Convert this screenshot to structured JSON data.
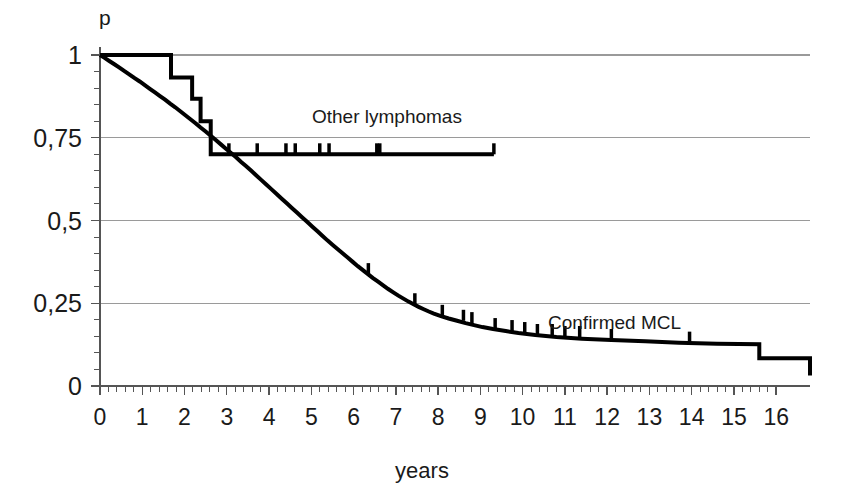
{
  "chart_data": {
    "type": "line",
    "title": "",
    "subtitle": "",
    "xlabel": "years",
    "ylabel": "p",
    "xlim": [
      0,
      16.8
    ],
    "ylim": [
      0,
      1
    ],
    "grid": true,
    "grid_axis": "y",
    "legend_position": "inline-annotations",
    "x_ticks": [
      "0",
      "1",
      "2",
      "3",
      "4",
      "5",
      "6",
      "7",
      "8",
      "9",
      "10",
      "11",
      "12",
      "13",
      "14",
      "15",
      "16"
    ],
    "x_tick_values": [
      0,
      1,
      2,
      3,
      4,
      5,
      6,
      7,
      8,
      9,
      10,
      11,
      12,
      13,
      14,
      15,
      16
    ],
    "x_minor_tick_interval": 0.2,
    "y_ticks": [
      "1",
      "0,75",
      "0,5",
      "0,25",
      "0"
    ],
    "y_tick_values": [
      1,
      0.75,
      0.5,
      0.25,
      0
    ],
    "y_minor_tick_interval": 0.05,
    "decimal_separator": ",",
    "line_color": "#000000",
    "grid_color": "#9a9a9a",
    "axis_color": "#555555",
    "background_color": "#ffffff",
    "series": [
      {
        "name": "Other lymphomas",
        "annotation": "Other lymphomas",
        "annotation_x": 5.0,
        "annotation_y": 0.845,
        "style": "step",
        "color": "#000000",
        "line_width": 4,
        "points": [
          [
            0.0,
            1.0
          ],
          [
            1.68,
            1.0
          ],
          [
            1.68,
            0.932
          ],
          [
            2.18,
            0.932
          ],
          [
            2.18,
            0.868
          ],
          [
            2.38,
            0.868
          ],
          [
            2.38,
            0.8
          ],
          [
            2.62,
            0.8
          ],
          [
            2.62,
            0.7
          ],
          [
            9.32,
            0.7
          ]
        ],
        "censored_x": [
          3.05,
          3.72,
          4.4,
          4.62,
          5.2,
          5.42,
          6.55,
          6.62,
          9.32
        ],
        "censored_y": 0.7
      },
      {
        "name": "Confirmed MCL",
        "annotation": "Confirmed MCL",
        "annotation_x": 11.4,
        "annotation_y": 0.205,
        "style": "step",
        "color": "#000000",
        "line_width": 4,
        "points": [
          [
            0.0,
            1.0
          ],
          [
            0.1,
            0.992
          ],
          [
            0.22,
            0.982
          ],
          [
            0.34,
            0.972
          ],
          [
            0.46,
            0.962
          ],
          [
            0.58,
            0.951
          ],
          [
            0.7,
            0.941
          ],
          [
            0.82,
            0.93
          ],
          [
            0.94,
            0.92
          ],
          [
            1.06,
            0.909
          ],
          [
            1.18,
            0.898
          ],
          [
            1.3,
            0.887
          ],
          [
            1.42,
            0.876
          ],
          [
            1.54,
            0.865
          ],
          [
            1.66,
            0.853
          ],
          [
            1.78,
            0.842
          ],
          [
            1.9,
            0.83
          ],
          [
            2.02,
            0.818
          ],
          [
            2.14,
            0.806
          ],
          [
            2.26,
            0.794
          ],
          [
            2.38,
            0.781
          ],
          [
            2.5,
            0.769
          ],
          [
            2.62,
            0.756
          ],
          [
            2.74,
            0.743
          ],
          [
            2.86,
            0.73
          ],
          [
            2.98,
            0.717
          ],
          [
            3.1,
            0.704
          ],
          [
            3.22,
            0.691
          ],
          [
            3.34,
            0.677
          ],
          [
            3.46,
            0.664
          ],
          [
            3.58,
            0.65
          ],
          [
            3.7,
            0.636
          ],
          [
            3.82,
            0.622
          ],
          [
            3.94,
            0.608
          ],
          [
            4.06,
            0.594
          ],
          [
            4.18,
            0.58
          ],
          [
            4.3,
            0.566
          ],
          [
            4.42,
            0.552
          ],
          [
            4.54,
            0.538
          ],
          [
            4.66,
            0.524
          ],
          [
            4.78,
            0.51
          ],
          [
            4.9,
            0.496
          ],
          [
            5.02,
            0.482
          ],
          [
            5.14,
            0.468
          ],
          [
            5.26,
            0.454
          ],
          [
            5.38,
            0.44
          ],
          [
            5.5,
            0.427
          ],
          [
            5.62,
            0.414
          ],
          [
            5.74,
            0.401
          ],
          [
            5.86,
            0.388
          ],
          [
            5.98,
            0.375
          ],
          [
            6.1,
            0.362
          ],
          [
            6.22,
            0.35
          ],
          [
            6.34,
            0.338
          ],
          [
            6.46,
            0.326
          ],
          [
            6.58,
            0.315
          ],
          [
            6.7,
            0.304
          ],
          [
            6.82,
            0.293
          ],
          [
            6.94,
            0.283
          ],
          [
            7.06,
            0.273
          ],
          [
            7.18,
            0.264
          ],
          [
            7.3,
            0.255
          ],
          [
            7.42,
            0.247
          ],
          [
            7.54,
            0.239
          ],
          [
            7.66,
            0.232
          ],
          [
            7.78,
            0.225
          ],
          [
            7.9,
            0.219
          ],
          [
            8.05,
            0.212
          ],
          [
            8.25,
            0.204
          ],
          [
            8.45,
            0.197
          ],
          [
            8.65,
            0.19
          ],
          [
            8.85,
            0.184
          ],
          [
            9.05,
            0.178
          ],
          [
            9.3,
            0.172
          ],
          [
            9.6,
            0.166
          ],
          [
            9.9,
            0.16
          ],
          [
            10.3,
            0.154
          ],
          [
            10.8,
            0.148
          ],
          [
            11.4,
            0.143
          ],
          [
            12.1,
            0.139
          ],
          [
            12.9,
            0.135
          ],
          [
            13.7,
            0.131
          ],
          [
            14.6,
            0.128
          ],
          [
            15.6,
            0.126
          ],
          [
            15.6,
            0.084
          ],
          [
            17.4,
            0.084
          ],
          [
            17.4,
            0.055
          ],
          [
            21.6,
            0.055
          ],
          [
            21.6,
            0.032
          ],
          [
            23.3,
            0.032
          ]
        ],
        "censored_x": [
          6.35,
          7.45,
          8.1,
          8.6,
          8.8,
          9.35,
          9.75,
          10.05,
          10.35,
          10.7,
          11.0,
          11.35,
          12.1,
          13.95
        ],
        "plateau_value": 0.125,
        "final_value": 0.03
      }
    ]
  },
  "annotations": {
    "y_axis_title": "p",
    "x_axis_title": "years",
    "series_other": "Other lymphomas",
    "series_mcl": "Confirmed MCL"
  }
}
